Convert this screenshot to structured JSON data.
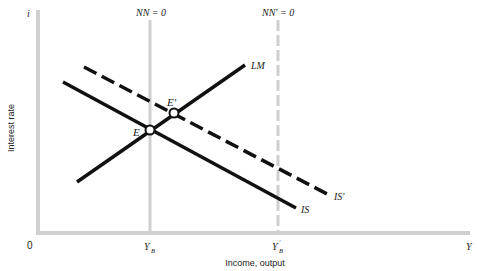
{
  "diagram": {
    "type": "IS-LM-NN",
    "axes": {
      "y_axis_symbol": "i",
      "y_axis_label": "Interest rate",
      "x_axis_symbol": "Y",
      "x_axis_label": "Income, output",
      "origin_label": "0",
      "x_ticks": [
        {
          "label_main": "Y",
          "label_sub": "B",
          "prime": ""
        },
        {
          "label_main": "Y",
          "label_sub": "B",
          "prime": "′"
        }
      ]
    },
    "vertical_lines": [
      {
        "label": "NN = 0",
        "style": "solid"
      },
      {
        "label": "NN′ = 0",
        "style": "dashed"
      }
    ],
    "curves": [
      {
        "name": "LM",
        "style": "solid"
      },
      {
        "name": "IS",
        "style": "solid"
      },
      {
        "name": "IS′",
        "style": "dashed"
      }
    ],
    "points": [
      {
        "label": "E"
      },
      {
        "label": "E′"
      }
    ],
    "colors": {
      "axis": "#d0d0d0",
      "curve": "#111111",
      "text": "#222222"
    }
  }
}
